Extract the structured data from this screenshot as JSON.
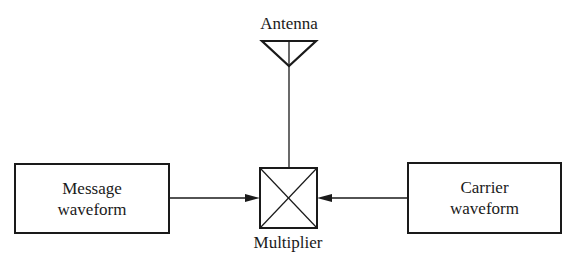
{
  "diagram": {
    "antenna": {
      "label": "Antenna"
    },
    "multiplier": {
      "label": "Multiplier"
    },
    "message": {
      "line1": "Message",
      "line2": "waveform"
    },
    "carrier": {
      "line1": "Carrier",
      "line2": "waveform"
    }
  }
}
